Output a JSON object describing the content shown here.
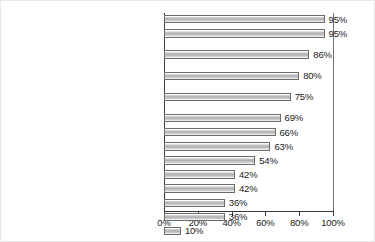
{
  "chart_data": {
    "type": "bar",
    "orientation": "horizontal",
    "title": "",
    "subtitle": "",
    "xlabel": "",
    "ylabel": "",
    "xlim": [
      0,
      100
    ],
    "ylim": null,
    "grid": false,
    "legend": null,
    "xticks": [
      "0%",
      "20%",
      "40%",
      "60%",
      "80%",
      "100%"
    ],
    "xtick_values": [
      0,
      20,
      40,
      60,
      80,
      100
    ],
    "categories": [
      "Retention and expansion",
      "Marketing/recruitment",
      "Economic development planning for the area you serve",
      "Community development functions",
      "New business start-ups and entrepreneur support",
      "Workforce development",
      "Research/data analysis",
      "Provide or assist with loans or grants",
      "Property development/redevelopment",
      "Leadership development",
      "Permitting assistance for businesses",
      "Retail development",
      "Downtown development",
      "Other"
    ],
    "category_lines": [
      [
        "Retention and expansion"
      ],
      [
        "Marketing/recruitment"
      ],
      [
        "Economic development planning",
        "for the area you serve"
      ],
      [
        "Community development functions"
      ],
      [
        "New business start-ups",
        "and entrepreneur support"
      ],
      [
        "Workforce development"
      ],
      [
        "Research/data analysis"
      ],
      [
        "Provide or assist with loans or grants"
      ],
      [
        "Property development/redevelopment"
      ],
      [
        "Leadership development"
      ],
      [
        "Permitting assistance for businesses"
      ],
      [
        "Retail development"
      ],
      [
        "Downtown development"
      ],
      [
        "Other"
      ]
    ],
    "values": [
      95,
      95,
      86,
      80,
      75,
      69,
      66,
      63,
      54,
      42,
      42,
      36,
      36,
      10
    ],
    "data_labels": [
      "95%",
      "95%",
      "86%",
      "80%",
      "75%",
      "69%",
      "66%",
      "63%",
      "54%",
      "42%",
      "42%",
      "36%",
      "36%",
      "10%"
    ],
    "colors": {
      "bar_fill": "#bdbdbd",
      "bar_border": "#6b6b6b",
      "axis": "#3a3a3a",
      "text": "#101010",
      "background": "#ffffff"
    }
  }
}
